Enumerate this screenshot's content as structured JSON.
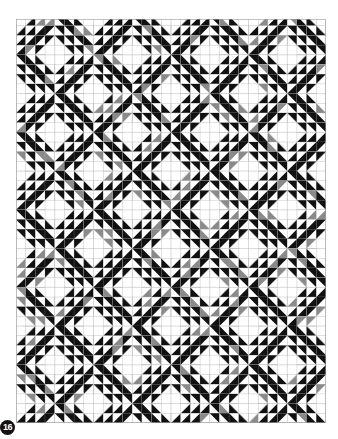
{
  "figure": {
    "label": "16",
    "colors": {
      "dark": "#111111",
      "gray": "#8a8a8a",
      "light": "#ffffff",
      "grid_line": "#b5b5b5",
      "diamond_line": "#c8c8c8"
    },
    "grid": {
      "cell_px": 9.6875,
      "columns": 32,
      "rows": 42,
      "lattice_period_cells": 8,
      "diamond_half_cells": 2,
      "offset_y_cells": -0.3
    }
  }
}
